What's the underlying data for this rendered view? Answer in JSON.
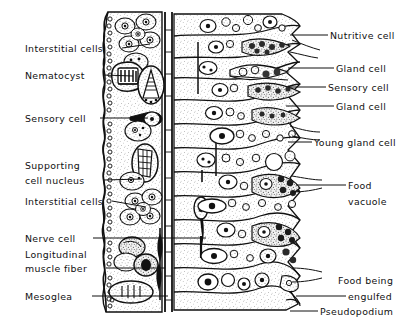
{
  "figure": {
    "type": "labeled-biological-diagram",
    "background_color": "#ffffff",
    "ink_color": "#111111",
    "stipple_color": "#6f6f6f"
  },
  "labels_left": [
    {
      "name": "interstitial-cells-upper",
      "text": "Interstitial cells",
      "x": 25,
      "y": 43,
      "leader_from_x": 122,
      "leader_from_y": 48,
      "leader_to_x": 150,
      "leader_to_y": 44
    },
    {
      "name": "nematocyst",
      "text": "Nematocyst",
      "x": 25,
      "y": 70,
      "leader_from_x": 103,
      "leader_from_y": 75,
      "leader_to_x": 133,
      "leader_to_y": 76
    },
    {
      "name": "sensory-cell-ectoderm",
      "text": "Sensory cell",
      "x": 25,
      "y": 113,
      "leader_from_x": 100,
      "leader_from_y": 118,
      "leader_to_x": 148,
      "leader_to_y": 118
    },
    {
      "name": "supporting-cell-nucleus-line1",
      "text": "Supporting",
      "x": 25,
      "y": 160
    },
    {
      "name": "supporting-cell-nucleus-line2",
      "text": "cell nucleus",
      "x": 25,
      "y": 175,
      "leader_from_x": 104,
      "leader_from_y": 180,
      "leader_to_x": 142,
      "leader_to_y": 179
    },
    {
      "name": "interstitial-cells-lower",
      "text": "Interstitial cells",
      "x": 25,
      "y": 196,
      "leader_from_x": 112,
      "leader_from_y": 201,
      "leader_to_x": 146,
      "leader_to_y": 207
    },
    {
      "name": "nerve-cell",
      "text": "Nerve cell",
      "x": 25,
      "y": 233,
      "leader_from_x": 93,
      "leader_from_y": 238,
      "leader_to_x": 206,
      "leader_to_y": 238
    },
    {
      "name": "longitudinal-muscle-fiber-line1",
      "text": "Longitudinal",
      "x": 25,
      "y": 249
    },
    {
      "name": "longitudinal-muscle-fiber-line2",
      "text": "muscle fiber",
      "x": 25,
      "y": 263,
      "leader_from_x": 106,
      "leader_from_y": 268,
      "leader_to_x": 165,
      "leader_to_y": 268
    },
    {
      "name": "mesoglea",
      "text": "Mesoglea",
      "x": 25,
      "y": 291,
      "leader_from_x": 92,
      "leader_from_y": 296,
      "leader_to_x": 168,
      "leader_to_y": 296
    }
  ],
  "labels_right": [
    {
      "name": "nutritive-cell",
      "text": "Nutritive cell",
      "x": 330,
      "y": 30,
      "leader_from_x": 290,
      "leader_from_y": 35,
      "leader_to_x": 328,
      "leader_to_y": 35
    },
    {
      "name": "gland-cell-upper",
      "text": "Gland cell",
      "x": 336,
      "y": 63,
      "leader_from_x": 288,
      "leader_from_y": 68,
      "leader_to_x": 334,
      "leader_to_y": 68
    },
    {
      "name": "sensory-cell-endoderm",
      "text": "Sensory cell",
      "x": 328,
      "y": 82,
      "leader_from_x": 288,
      "leader_from_y": 87,
      "leader_to_x": 326,
      "leader_to_y": 87
    },
    {
      "name": "gland-cell-lower",
      "text": "Gland cell",
      "x": 336,
      "y": 101,
      "leader_from_x": 286,
      "leader_from_y": 106,
      "leader_to_x": 334,
      "leader_to_y": 106
    },
    {
      "name": "young-gland-cell",
      "text": "Young gland cell",
      "x": 314,
      "y": 137,
      "leader_from_x": 288,
      "leader_from_y": 142,
      "leader_to_x": 312,
      "leader_to_y": 142
    },
    {
      "name": "food-vacuole-line1",
      "text": "Food",
      "x": 348,
      "y": 180,
      "leader_from_x": 296,
      "leader_from_y": 185,
      "leader_to_x": 346,
      "leader_to_y": 185
    },
    {
      "name": "food-vacuole-line2",
      "text": "vacuole",
      "x": 348,
      "y": 196
    },
    {
      "name": "food-being-engulfed-line1",
      "text": "Food being",
      "x": 338,
      "y": 275
    },
    {
      "name": "food-being-engulfed-line2",
      "text": "engulfed",
      "x": 348,
      "y": 291,
      "leader_from_x": 296,
      "leader_from_y": 296,
      "leader_to_x": 346,
      "leader_to_y": 296
    },
    {
      "name": "pseudopodium",
      "text": "Pseudopodium",
      "x": 320,
      "y": 306,
      "leader_from_x": 290,
      "leader_from_y": 311,
      "leader_to_x": 318,
      "leader_to_y": 311
    }
  ],
  "structures": {
    "ectoderm": {
      "name": "ectoderm-layer",
      "left_x": 100,
      "right_x": 162,
      "top_y": 12,
      "bottom_y": 312
    },
    "mesoglea_band": {
      "name": "mesoglea-band",
      "left_x": 162,
      "right_x": 174,
      "top_y": 12,
      "bottom_y": 312
    },
    "endoderm": {
      "name": "endoderm-layer",
      "left_x": 174,
      "right_x": 300,
      "top_y": 12,
      "bottom_y": 312
    }
  }
}
